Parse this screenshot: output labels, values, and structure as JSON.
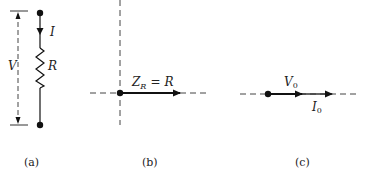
{
  "figure": {
    "panels": [
      {
        "id": "a",
        "caption": "(a)",
        "description": "resistor circuit element",
        "labels": {
          "current": "I",
          "voltage": "V",
          "resistance": "R"
        }
      },
      {
        "id": "b",
        "caption": "(b)",
        "description": "impedance phasor of resistor",
        "labels": {
          "impedance_main": "Z",
          "impedance_sub": "R",
          "equals": "=",
          "value": "R"
        }
      },
      {
        "id": "c",
        "caption": "(c)",
        "description": "voltage and current phasors in phase",
        "labels": {
          "voltage_main": "V",
          "voltage_sub": "0",
          "current_main": "I",
          "current_sub": "0"
        }
      }
    ]
  },
  "colors": {
    "ink": "#111111",
    "dash": "#555555",
    "background": "#ffffff"
  }
}
